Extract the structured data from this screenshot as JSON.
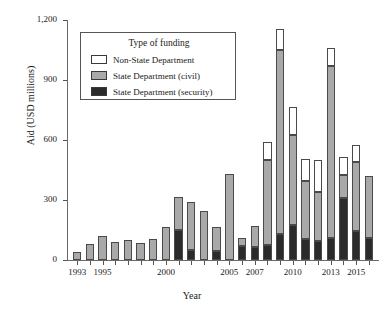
{
  "chart_data": {
    "type": "bar",
    "subtype": "stacked-bar",
    "title": "",
    "xlabel": "Year",
    "ylabel": "Aid (USD millions)",
    "ylim": [
      0,
      1200
    ],
    "yticks": [
      "0",
      "300",
      "600",
      "900",
      "1,200"
    ],
    "ytick_values": [
      0,
      300,
      600,
      900,
      1200
    ],
    "grid": false,
    "legend_position": "upper-left-inside",
    "legend_title": "Type of funding",
    "categories": [
      "1993",
      "1994",
      "1995",
      "1996",
      "1997",
      "1998",
      "1999",
      "2000",
      "2001",
      "2002",
      "2003",
      "2004",
      "2005",
      "2006",
      "2007",
      "2008",
      "2009",
      "2010",
      "2011",
      "2012",
      "2013",
      "2014",
      "2015",
      "2016"
    ],
    "xtick_labels": [
      "1993",
      "1995",
      "2000",
      "2005",
      "2007",
      "2010",
      "2013",
      "2015"
    ],
    "xtick_label_categories": [
      "1993",
      "1995",
      "2000",
      "2005",
      "2007",
      "2010",
      "2013",
      "2015"
    ],
    "series": [
      {
        "name": "State Department (security)",
        "color": "#2b2b2b",
        "values": [
          0,
          0,
          0,
          0,
          0,
          0,
          0,
          0,
          0,
          0,
          0,
          0,
          0,
          0,
          0,
          88,
          107,
          136,
          111,
          163,
          92,
          91,
          88,
          0
        ]
      },
      {
        "name": "State Department (civil)",
        "color": "#a9a9a9",
        "values": [
          42,
          82,
          120,
          88,
          98,
          85,
          107,
          167,
          167,
          240,
          243,
          118,
          428,
          43,
          107,
          423,
          918,
          451,
          290,
          245,
          860,
          112,
          346,
          311
        ]
      },
      {
        "name": "Non-State Department",
        "color": "#ffffff",
        "values": [
          0,
          0,
          0,
          0,
          0,
          0,
          0,
          0,
          150,
          50,
          0,
          45,
          0,
          68,
          65,
          77,
          131,
          176,
          103,
          94,
          110,
          311,
          143,
          110
        ]
      }
    ],
    "totals": [
      42,
      82,
      120,
      88,
      98,
      85,
      107,
      167,
      317,
      290,
      243,
      163,
      428,
      111,
      172,
      588,
      1156,
      763,
      504,
      502,
      1062,
      514,
      577,
      421
    ]
  },
  "legend": {
    "title": "Type of funding",
    "items": [
      {
        "label": "Non-State Department",
        "swatch": "white"
      },
      {
        "label": "State Department (civil)",
        "swatch": "gray"
      },
      {
        "label": "State Department (security)",
        "swatch": "black"
      }
    ]
  },
  "colors": {
    "non_state": "#ffffff",
    "state_civil": "#a9a9a9",
    "state_security": "#2b2b2b",
    "axis": "#6a6a6a",
    "background": "#ffffff"
  }
}
